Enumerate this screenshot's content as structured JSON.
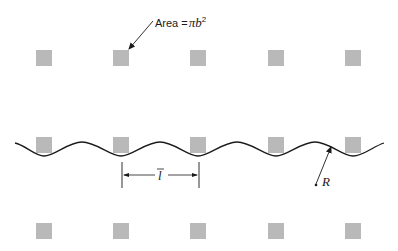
{
  "figure": {
    "area_label": {
      "prefix": "Area =",
      "symbol": "π",
      "var": "b",
      "exponent": "2"
    },
    "spacing_label": "l",
    "radius_label": "R",
    "colors": {
      "square": "#b9b9b9",
      "line": "#1a1a1a",
      "background": "#ffffff"
    },
    "grid": {
      "columns_x": [
        36,
        113,
        190,
        268,
        345
      ],
      "rows_y": [
        50,
        137,
        223
      ],
      "square_size": 16
    }
  }
}
